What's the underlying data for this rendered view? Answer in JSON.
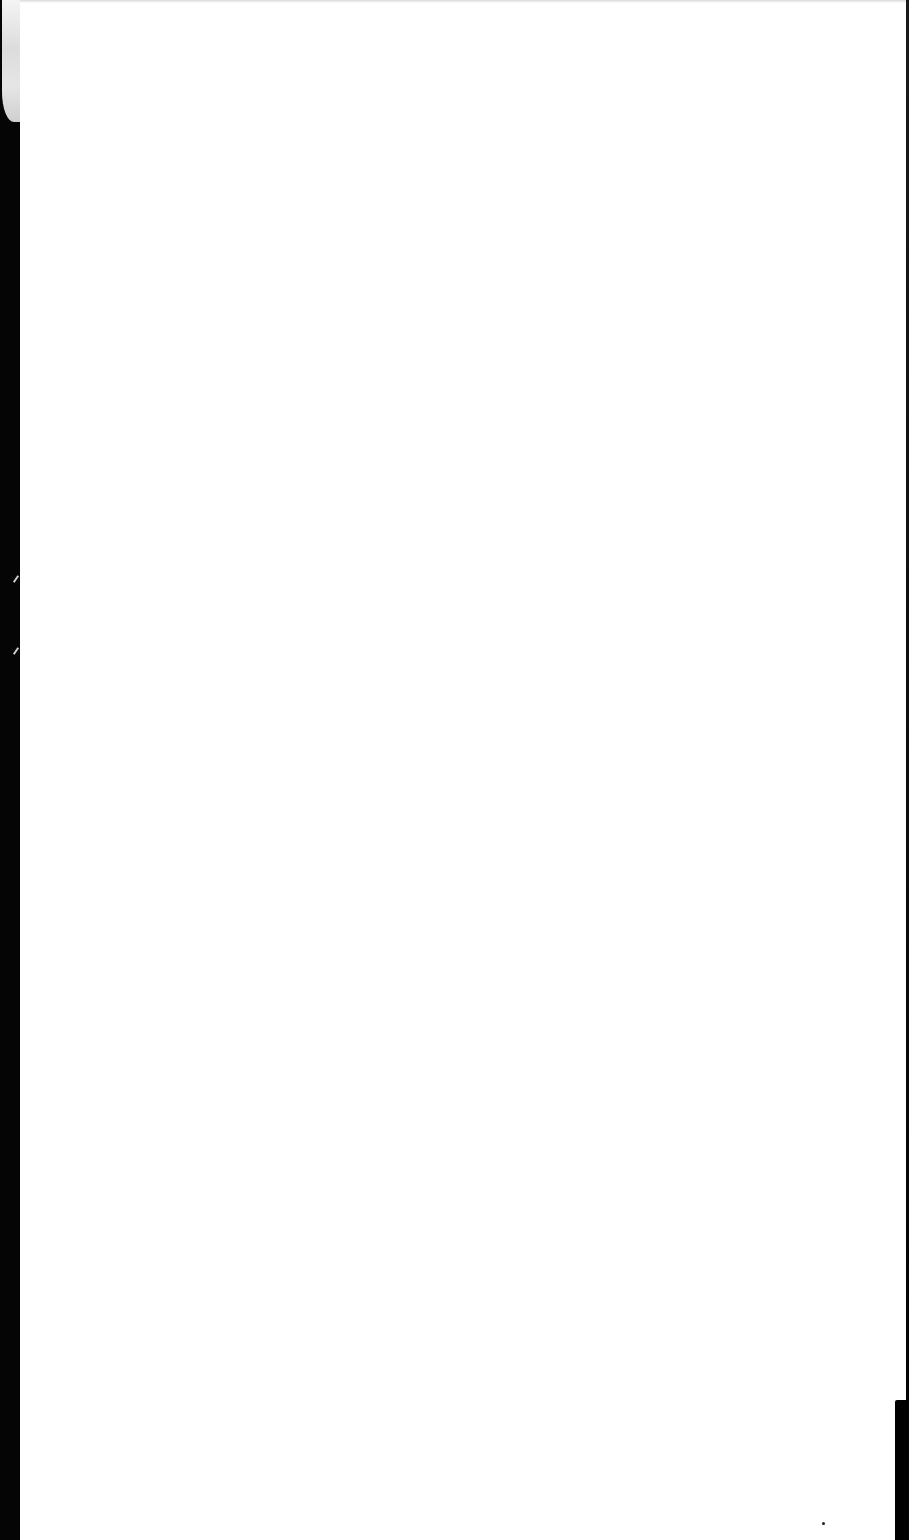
{
  "document": {
    "type": "scanned-page",
    "description": "Blank scanned page; no legible content",
    "visible_text": "",
    "colors": {
      "paper": "#ffffff",
      "scanner_border": "#050505"
    }
  }
}
